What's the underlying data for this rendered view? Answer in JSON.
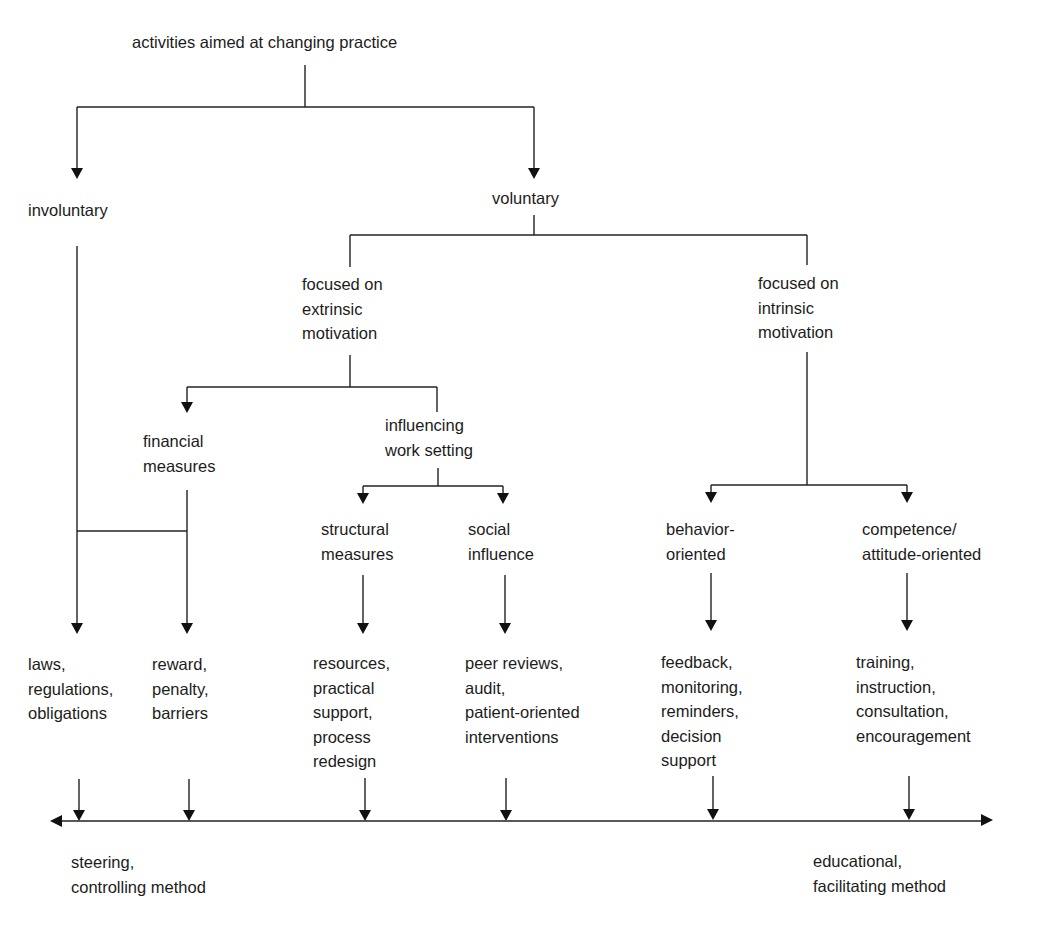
{
  "diagram": {
    "root": "activities aimed at changing practice",
    "involuntary": "involuntary",
    "voluntary": "voluntary",
    "extrinsic": "focused on\nextrinsic\nmotivation",
    "intrinsic": "focused on\nintrinsic\nmotivation",
    "financial": "financial\nmeasures",
    "work_setting": "influencing\nwork setting",
    "structural": "structural\nmeasures",
    "social": "social\ninfluence",
    "behavior": "behavior-\noriented",
    "competence": "competence/\nattitude-oriented",
    "leaves": {
      "laws": "laws,\nregulations,\nobligations",
      "reward": "reward,\npenalty,\nbarriers",
      "resources": "resources,\npractical\nsupport,\nprocess\nredesign",
      "peer": "peer reviews,\naudit,\npatient-oriented\ninterventions",
      "feedback": "feedback,\nmonitoring,\nreminders,\ndecision\nsupport",
      "training": "training,\ninstruction,\nconsultation,\nencouragement"
    },
    "axis": {
      "left_label": "steering,\ncontrolling method",
      "right_label": "educational,\nfacilitating method"
    }
  }
}
